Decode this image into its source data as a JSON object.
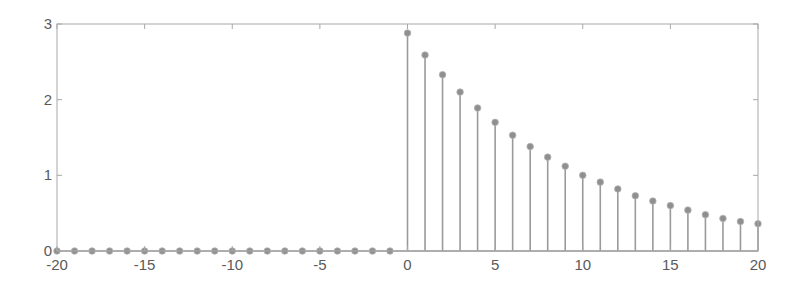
{
  "chart_data": {
    "type": "stem",
    "title": "",
    "xlabel": "",
    "ylabel": "",
    "xlim": [
      -20,
      20
    ],
    "ylim": [
      0,
      3
    ],
    "grid": false,
    "legend": null,
    "xticks": [
      -20,
      -15,
      -10,
      -5,
      0,
      5,
      10,
      15,
      20
    ],
    "yticks": [
      0,
      1,
      2,
      3
    ],
    "xtick_labels": [
      "-20",
      "-15",
      "-10",
      "-5",
      "0",
      "5",
      "10",
      "15",
      "20"
    ],
    "ytick_labels": [
      "0",
      "1",
      "2",
      "3"
    ],
    "x": [
      -20,
      -19,
      -18,
      -17,
      -16,
      -15,
      -14,
      -13,
      -12,
      -11,
      -10,
      -9,
      -8,
      -7,
      -6,
      -5,
      -4,
      -3,
      -2,
      -1,
      0,
      1,
      2,
      3,
      4,
      5,
      6,
      7,
      8,
      9,
      10,
      11,
      12,
      13,
      14,
      15,
      16,
      17,
      18,
      19,
      20
    ],
    "values": [
      0,
      0,
      0,
      0,
      0,
      0,
      0,
      0,
      0,
      0,
      0,
      0,
      0,
      0,
      0,
      0,
      0,
      0,
      0,
      0,
      2.88,
      2.59,
      2.33,
      2.1,
      1.89,
      1.7,
      1.53,
      1.38,
      1.24,
      1.12,
      1.0,
      0.91,
      0.82,
      0.73,
      0.66,
      0.6,
      0.54,
      0.48,
      0.43,
      0.39,
      0.36
    ],
    "colors": {
      "stem": "#9a9a9a",
      "marker": "#8f8f8f",
      "axis": "#a8a8a8",
      "text": "#5a5a5a"
    }
  }
}
